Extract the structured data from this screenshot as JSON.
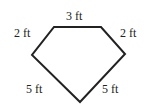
{
  "figure": {
    "shape": "pentagon",
    "vertices": [
      [
        54,
        27
      ],
      [
        101,
        27
      ],
      [
        125,
        54
      ],
      [
        80,
        102
      ],
      [
        32,
        55
      ]
    ],
    "stroke_color": "#222222",
    "sides": [
      {
        "id": "top",
        "label": "3 ft"
      },
      {
        "id": "upper-right",
        "label": "2 ft"
      },
      {
        "id": "lower-right",
        "label": "5 ft"
      },
      {
        "id": "lower-left",
        "label": "5 ft"
      },
      {
        "id": "upper-left",
        "label": "2 ft"
      }
    ]
  }
}
